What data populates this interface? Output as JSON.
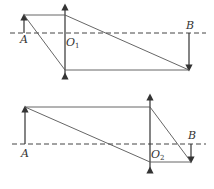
{
  "diagram_1": {
    "object_label": "A",
    "image_label": "B",
    "lens_label": "O",
    "lens_subscript": "1"
  },
  "diagram_2": {
    "object_label": "A",
    "image_label": "B",
    "lens_label": "O",
    "lens_subscript": "2"
  },
  "colors": {
    "line": "#333333",
    "ray": "#555555",
    "axis": "#444444"
  }
}
